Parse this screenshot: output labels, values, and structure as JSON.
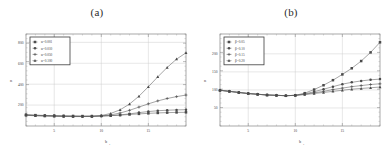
{
  "figure": {
    "panels": [
      {
        "id": "panel-a",
        "title": "(a)",
        "chart_data": {
          "type": "line",
          "title": "(a)",
          "xlabel": "b",
          "xlabel_sub": "1",
          "ylabel": "n",
          "xlim": [
            2,
            19
          ],
          "ylim": [
            0,
            880
          ],
          "xticks": [
            5,
            10,
            15
          ],
          "yticks": [
            200,
            400,
            600,
            800
          ],
          "grid": true,
          "legend_position": "top-left",
          "x": [
            2,
            3,
            4,
            5,
            6,
            7,
            8,
            9,
            10,
            11,
            12,
            13,
            14,
            15,
            16,
            17,
            18,
            19
          ],
          "series": [
            {
              "name": "α=0.001",
              "marker": "square",
              "values": [
                108,
                104,
                101,
                99,
                97,
                96,
                95,
                95,
                96,
                99,
                104,
                110,
                116,
                121,
                125,
                128,
                130,
                131
              ]
            },
            {
              "name": "α=0.010",
              "marker": "circle",
              "values": [
                106,
                102,
                99,
                97,
                95,
                94,
                93,
                93,
                95,
                99,
                106,
                116,
                128,
                138,
                146,
                151,
                154,
                156
              ]
            },
            {
              "name": "α=0.050",
              "marker": "plus",
              "values": [
                104,
                100,
                97,
                95,
                93,
                92,
                91,
                92,
                96,
                106,
                124,
                150,
                181,
                212,
                240,
                263,
                281,
                296
              ]
            },
            {
              "name": "α=0.100",
              "marker": "triangle",
              "values": [
                102,
                98,
                95,
                93,
                91,
                90,
                90,
                92,
                100,
                120,
                155,
                210,
                285,
                375,
                470,
                560,
                640,
                700
              ]
            }
          ]
        }
      },
      {
        "id": "panel-b",
        "title": "(b)",
        "chart_data": {
          "type": "line",
          "title": "(b)",
          "xlabel": "b",
          "xlabel_sub": "1",
          "ylabel": "n",
          "xlim": [
            2,
            19
          ],
          "ylim": [
            0,
            255
          ],
          "xticks": [
            5,
            10,
            15
          ],
          "yticks": [
            50,
            100,
            150,
            200
          ],
          "grid": true,
          "legend_position": "top-left",
          "x": [
            2,
            3,
            4,
            5,
            6,
            7,
            8,
            9,
            10,
            11,
            12,
            13,
            14,
            15,
            16,
            17,
            18,
            19
          ],
          "series": [
            {
              "name": "β=0.05",
              "marker": "square",
              "values": [
                99,
                96,
                93,
                90,
                88,
                86,
                85,
                84,
                85,
                91,
                101,
                113,
                127,
                143,
                160,
                180,
                204,
                232
              ]
            },
            {
              "name": "β=0.10",
              "marker": "circle",
              "values": [
                99,
                96,
                93,
                90,
                88,
                86,
                85,
                84,
                85,
                89,
                95,
                102,
                109,
                116,
                121,
                125,
                128,
                130
              ]
            },
            {
              "name": "β=0.15",
              "marker": "plus",
              "values": [
                99,
                96,
                93,
                90,
                88,
                86,
                85,
                84,
                85,
                88,
                92,
                96,
                101,
                105,
                109,
                112,
                115,
                117
              ]
            },
            {
              "name": "β=0.20",
              "marker": "triangle",
              "values": [
                99,
                96,
                93,
                90,
                88,
                86,
                85,
                84,
                85,
                87,
                90,
                93,
                96,
                99,
                102,
                104,
                106,
                108
              ]
            }
          ]
        }
      }
    ]
  }
}
